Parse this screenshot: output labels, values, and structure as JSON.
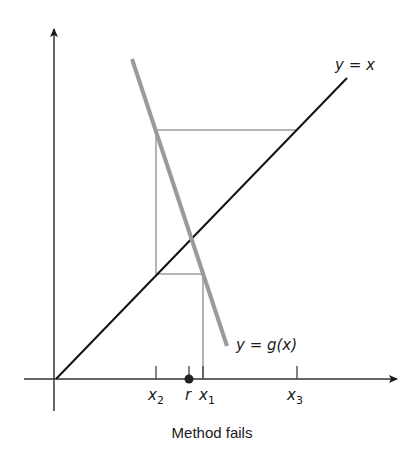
{
  "diagram": {
    "caption": "Method fails",
    "curves": {
      "identity_label": "y = x",
      "g_label_prefix": "y = ",
      "g_label_func": "g",
      "g_label_arg": "(x)"
    },
    "ticks": [
      {
        "name": "x",
        "sub": "2"
      },
      {
        "name": "r",
        "sub": ""
      },
      {
        "name": "x",
        "sub": "1"
      },
      {
        "name": "x",
        "sub": "3"
      }
    ],
    "colors": {
      "axis": "#1a1a1a",
      "identity_line": "#111111",
      "g_line": "#9a9a9a",
      "cobweb": "#6a6a6a",
      "root_dot": "#222222"
    }
  }
}
